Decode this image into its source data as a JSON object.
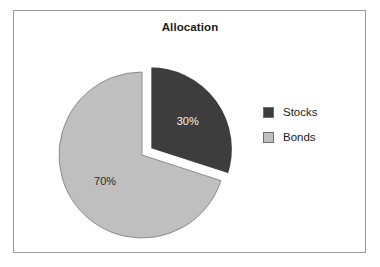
{
  "chart_data": {
    "type": "pie",
    "title": "Allocation",
    "categories": [
      "Stocks",
      "Bonds"
    ],
    "values": [
      30,
      70
    ],
    "value_labels": [
      "30%",
      "70%"
    ],
    "unit": "%",
    "colors": [
      "#3d3d3d",
      "#bfbfbf"
    ],
    "legend_position": "right",
    "grid": false,
    "start_angle_deg": 0,
    "direction": "clockwise",
    "exploded_slices": [
      "Stocks"
    ],
    "xlabel": "",
    "ylabel": ""
  },
  "frame": {
    "border_color": "#9a9a9a",
    "background": "#ffffff"
  },
  "legend": {
    "items": [
      {
        "label": "Stocks",
        "color": "#3d3d3d"
      },
      {
        "label": "Bonds",
        "color": "#bfbfbf"
      }
    ]
  }
}
